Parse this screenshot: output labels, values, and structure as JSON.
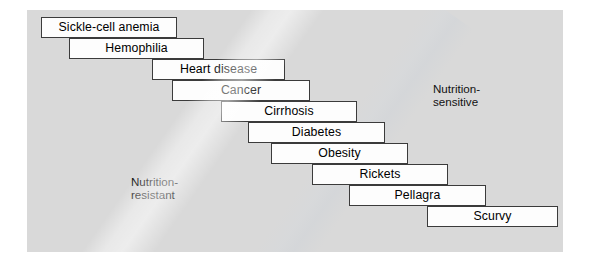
{
  "figure": {
    "kind": "staircase-diagram",
    "panel_color": "#d9d9d9",
    "box_fill": "#fdfdfd",
    "box_border": "#3b3b3b"
  },
  "annotations": {
    "sensitive": "Nutrition-\nsensitive",
    "resistant": "Nutrition-\nresistant"
  },
  "steps": [
    {
      "label": "Sickle-cell anemia",
      "x": 41,
      "y": 17,
      "w": 136,
      "h": 21
    },
    {
      "label": "Hemophilia",
      "x": 69,
      "y": 38,
      "w": 135,
      "h": 21
    },
    {
      "label": "Heart disease",
      "x": 152,
      "y": 59,
      "w": 133,
      "h": 21
    },
    {
      "label": "Cancer",
      "x": 172,
      "y": 80,
      "w": 138,
      "h": 21
    },
    {
      "label": "Cirrhosis",
      "x": 221,
      "y": 101,
      "w": 136,
      "h": 21
    },
    {
      "label": "Diabetes",
      "x": 248,
      "y": 122,
      "w": 137,
      "h": 21
    },
    {
      "label": "Obesity",
      "x": 271,
      "y": 143,
      "w": 137,
      "h": 21
    },
    {
      "label": "Rickets",
      "x": 312,
      "y": 164,
      "w": 136,
      "h": 21
    },
    {
      "label": "Pellagra",
      "x": 349,
      "y": 185,
      "w": 137,
      "h": 21
    },
    {
      "label": "Scurvy",
      "x": 427,
      "y": 206,
      "w": 131,
      "h": 21
    }
  ]
}
